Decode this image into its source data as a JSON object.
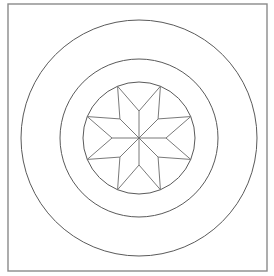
{
  "figure": {
    "description": "Line drawing: eight-pointed star inscribed in a circle, surrounded by two concentric circles, enclosed in a square frame",
    "canvas": {
      "width": 274,
      "height": 276,
      "background": "#ffffff"
    },
    "frame": {
      "x": 8,
      "y": 4,
      "width": 259,
      "height": 267,
      "stroke": "#8a8a8a"
    },
    "center": {
      "x": 139,
      "y": 138
    },
    "circles": [
      {
        "name": "outer",
        "r": 118,
        "stroke": "#5a5a5a"
      },
      {
        "name": "middle",
        "r": 79,
        "stroke": "#5a5a5a"
      },
      {
        "name": "inner",
        "r": 56,
        "stroke": "#5a5a5a"
      }
    ],
    "star": {
      "points": 8,
      "tip_radius": 56,
      "inner_vertex_radius": 27,
      "tip_angle_offset_deg": 22.5,
      "stroke": "#6a6a6a"
    }
  }
}
